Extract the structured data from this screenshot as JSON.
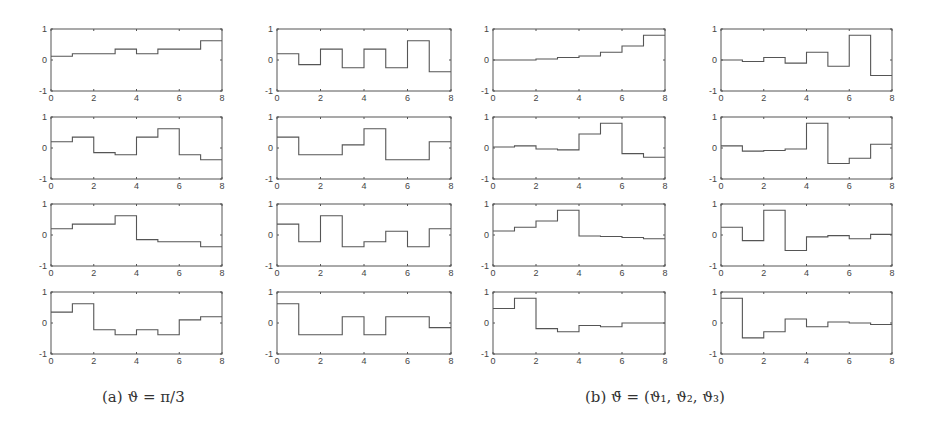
{
  "captions": {
    "a": "(a)  ϑ = π/3",
    "b": "(b)  ϑ̄ = (ϑ₁, ϑ₂, ϑ₃)"
  },
  "colors": {
    "line": "#555555",
    "axis": "#555555",
    "background": "#ffffff"
  },
  "chart_data": {
    "type": "line",
    "step": true,
    "layout": "4 rows x 4 columns of step plots; columns 1-2 = panel (a), columns 3-4 = panel (b)",
    "xlim": [
      0,
      8
    ],
    "ylim": [
      -1,
      1
    ],
    "xticks": [
      0,
      2,
      4,
      6,
      8
    ],
    "yticks": [
      -1,
      0,
      1
    ],
    "grid": false,
    "x_edges": [
      0,
      1,
      2,
      3,
      4,
      5,
      6,
      7,
      8
    ],
    "panels": [
      {
        "name": "(a) ϑ = π/3",
        "plots": [
          {
            "row": 1,
            "col": 1,
            "values": [
              0.12,
              0.2,
              0.2,
              0.35,
              0.2,
              0.35,
              0.35,
              0.62
            ]
          },
          {
            "row": 1,
            "col": 2,
            "values": [
              0.2,
              -0.15,
              0.35,
              -0.25,
              0.35,
              -0.25,
              0.62,
              -0.38
            ]
          },
          {
            "row": 2,
            "col": 1,
            "values": [
              0.2,
              0.35,
              -0.15,
              -0.22,
              0.35,
              0.62,
              -0.22,
              -0.38
            ]
          },
          {
            "row": 2,
            "col": 2,
            "values": [
              0.35,
              -0.22,
              -0.22,
              0.1,
              0.62,
              -0.38,
              -0.38,
              0.2
            ]
          },
          {
            "row": 3,
            "col": 1,
            "values": [
              0.2,
              0.35,
              0.35,
              0.62,
              -0.15,
              -0.22,
              -0.22,
              -0.38
            ]
          },
          {
            "row": 3,
            "col": 2,
            "values": [
              0.35,
              -0.22,
              0.62,
              -0.38,
              -0.22,
              0.12,
              -0.38,
              0.2
            ]
          },
          {
            "row": 4,
            "col": 1,
            "values": [
              0.35,
              0.62,
              -0.22,
              -0.38,
              -0.22,
              -0.38,
              0.1,
              0.2
            ]
          },
          {
            "row": 4,
            "col": 2,
            "values": [
              0.62,
              -0.38,
              -0.38,
              0.2,
              -0.38,
              0.2,
              0.2,
              -0.15
            ]
          }
        ]
      },
      {
        "name": "(b) ϑ̄ = (ϑ1, ϑ2, ϑ3)",
        "plots": [
          {
            "row": 1,
            "col": 3,
            "values": [
              0.0,
              0.0,
              0.03,
              0.08,
              0.13,
              0.25,
              0.45,
              0.8
            ]
          },
          {
            "row": 1,
            "col": 4,
            "values": [
              0.0,
              -0.05,
              0.08,
              -0.1,
              0.25,
              -0.2,
              0.8,
              -0.5
            ]
          },
          {
            "row": 2,
            "col": 3,
            "values": [
              0.03,
              0.07,
              -0.03,
              -0.06,
              0.45,
              0.8,
              -0.18,
              -0.3
            ]
          },
          {
            "row": 2,
            "col": 4,
            "values": [
              0.07,
              -0.1,
              -0.08,
              -0.03,
              0.8,
              -0.5,
              -0.33,
              0.12
            ]
          },
          {
            "row": 3,
            "col": 3,
            "values": [
              0.13,
              0.25,
              0.45,
              0.8,
              -0.03,
              -0.05,
              -0.08,
              -0.12
            ]
          },
          {
            "row": 3,
            "col": 4,
            "values": [
              0.25,
              -0.18,
              0.8,
              -0.5,
              -0.06,
              -0.02,
              -0.12,
              0.02
            ]
          },
          {
            "row": 4,
            "col": 3,
            "values": [
              0.47,
              0.8,
              -0.18,
              -0.28,
              -0.08,
              -0.12,
              0.0,
              0.0
            ]
          },
          {
            "row": 4,
            "col": 4,
            "values": [
              0.8,
              -0.48,
              -0.28,
              0.13,
              -0.12,
              0.03,
              0.0,
              -0.05
            ]
          }
        ]
      }
    ]
  }
}
